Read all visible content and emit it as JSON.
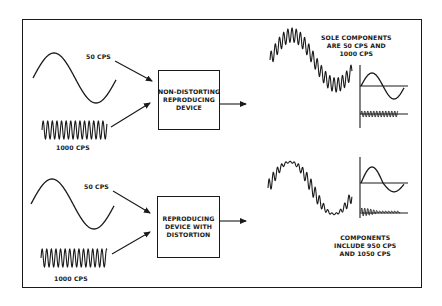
{
  "figure": {
    "top_panel": {
      "input_low_label": "50 CPS",
      "input_high_label": "1000 CPS",
      "device_lines": [
        "NON-DISTORTING",
        "REPRODUCING",
        "DEVICE"
      ],
      "result_lines": [
        "SOLE COMPONENTS",
        "ARE 50 CPS AND",
        "1000 CPS"
      ]
    },
    "bottom_panel": {
      "input_low_label": "50 CPS",
      "input_high_label": "1000 CPS",
      "device_lines": [
        "REPRODUCING",
        "DEVICE WITH",
        "DISTORTION"
      ],
      "result_lines": [
        "COMPONENTS",
        "INCLUDE 950 CPS",
        "AND 1050 CPS"
      ]
    },
    "colors": {
      "ink": "#1a1a1a",
      "paper": "#ffffff"
    }
  }
}
